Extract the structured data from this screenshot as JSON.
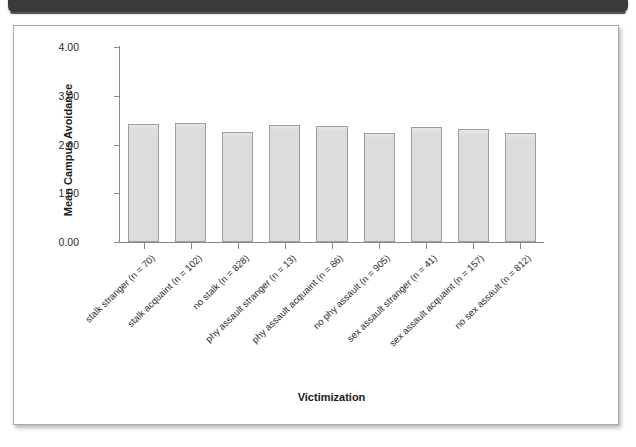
{
  "figure": {
    "scan_artifact_color": "#3b3b3b",
    "frame_border_color": "#a9a9a9"
  },
  "chart_data": {
    "type": "bar",
    "title": "",
    "xlabel": "Victimization",
    "ylabel": "Mean Campus Avoidance",
    "ylim": [
      0.0,
      4.0
    ],
    "yticks": [
      0.0,
      1.0,
      2.0,
      3.0,
      4.0
    ],
    "ytick_labels": [
      "0.00",
      "1.00",
      "2.00",
      "3.00",
      "4.00"
    ],
    "grid": false,
    "legend": false,
    "bar_fill_color": "#dcdcdc",
    "bar_edge_color": "#9e9e9e",
    "categories": [
      "stalk stranger (n = 70)",
      "stalk acquaint (n = 102)",
      "no stalk (n = 828)",
      "phy assault stranger (n = 13)",
      "phy assault acquaint (n = 86)",
      "no phy assault (n = 905)",
      "sex assault stranger (n = 41)",
      "sex assault acquaint (n = 157)",
      "no sex assault (n = 812)"
    ],
    "values": [
      2.42,
      2.44,
      2.26,
      2.4,
      2.38,
      2.24,
      2.36,
      2.32,
      2.23
    ],
    "group_counts": [
      70,
      102,
      828,
      13,
      86,
      905,
      41,
      157,
      812
    ]
  }
}
